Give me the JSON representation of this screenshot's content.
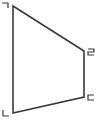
{
  "diagram": {
    "type": "quadrilateral",
    "stroke_color": "#3a3a3a",
    "vertices": [
      {
        "id": "top-left",
        "x": 13,
        "y": 6,
        "label_glyph": "corner-top-right"
      },
      {
        "id": "top-right",
        "x": 84,
        "y": 51,
        "label_glyph": "two-like"
      },
      {
        "id": "bottom-right",
        "x": 84,
        "y": 97,
        "label_glyph": "c-like"
      },
      {
        "id": "bottom-left",
        "x": 13,
        "y": 113,
        "label_glyph": "l-like"
      }
    ]
  }
}
